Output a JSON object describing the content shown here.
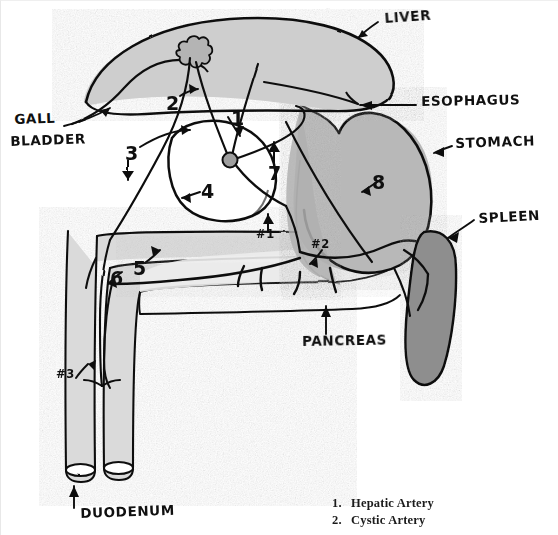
{
  "diagram": {
    "title_visible": false,
    "style": "hand-drawn pencil anatomical sketch, grayscale",
    "organ_labels": [
      {
        "id": "liver",
        "text": "LIVER",
        "x": 384,
        "y": 17,
        "rotate": -4
      },
      {
        "id": "esophagus",
        "text": "ESOPHAGUS",
        "x": 421,
        "y": 99,
        "rotate": -1
      },
      {
        "id": "stomach",
        "text": "STOMACH",
        "x": 455,
        "y": 140,
        "rotate": -2
      },
      {
        "id": "spleen",
        "text": "SPLEEN",
        "x": 478,
        "y": 216,
        "rotate": -3
      },
      {
        "id": "gall-bladder",
        "text": "GALL",
        "x": 14,
        "y": 119,
        "rotate": -2
      },
      {
        "id": "gall-bladder2",
        "text": "BLADDER",
        "x": 10,
        "y": 141,
        "rotate": -2
      },
      {
        "id": "pancreas",
        "text": "PANCREAS",
        "x": 302,
        "y": 340,
        "rotate": -1
      },
      {
        "id": "duodenum",
        "text": "DUODENUM",
        "x": 80,
        "y": 512,
        "rotate": -2
      }
    ],
    "number_labels": [
      {
        "id": "n1",
        "text": "1",
        "x": 231,
        "y": 110
      },
      {
        "id": "n2",
        "text": "2",
        "x": 166,
        "y": 95
      },
      {
        "id": "n3",
        "text": "3",
        "x": 127,
        "y": 146
      },
      {
        "id": "n4",
        "text": "4",
        "x": 203,
        "y": 184
      },
      {
        "id": "n5",
        "text": "5",
        "x": 133,
        "y": 262
      },
      {
        "id": "n6",
        "text": "6",
        "x": 110,
        "y": 273
      },
      {
        "id": "n7",
        "text": "7",
        "x": 270,
        "y": 167
      },
      {
        "id": "n8",
        "text": "8",
        "x": 372,
        "y": 177
      }
    ],
    "hash_labels": [
      {
        "id": "h1",
        "text": "#1",
        "x": 258,
        "y": 225
      },
      {
        "id": "h2",
        "text": "#2",
        "x": 311,
        "y": 241
      },
      {
        "id": "h3",
        "text": "#3",
        "x": 56,
        "y": 371
      }
    ]
  },
  "legend": {
    "items": [
      {
        "number": "1.",
        "label": "Hepatic Artery"
      },
      {
        "number": "2.",
        "label": "Cystic Artery"
      }
    ]
  },
  "colors": {
    "ink": "#101010",
    "paper": "#ffffff",
    "liver_fill": "#cfcfcf",
    "stomach_fill": "#b4b4b4",
    "spleen_fill": "#8b8b8b",
    "duodenum_fill": "#d6d6d6",
    "pancreas_fill": "#ededed",
    "gallbladder_fill": "#ffffff",
    "nodule_fill": "#a8a8a8"
  }
}
